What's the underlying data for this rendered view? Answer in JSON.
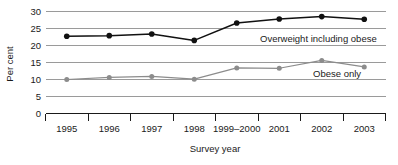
{
  "chart_data": {
    "type": "line",
    "title": "",
    "xlabel": "Survey year",
    "ylabel": "Per cent",
    "categories": [
      "1995",
      "1996",
      "1997",
      "1998",
      "1999–2000",
      "2001",
      "2002",
      "2003"
    ],
    "ylim": [
      0,
      30
    ],
    "ytick_values": [
      0,
      5,
      10,
      15,
      20,
      25,
      30
    ],
    "ytick_labels": [
      "0",
      "5",
      "10",
      "15",
      "20",
      "25",
      "30"
    ],
    "grid": true,
    "legend_position": "inline-annotation",
    "series": [
      {
        "name": "Overweight including obese",
        "color": "#111111",
        "marker": "circle-filled",
        "values": [
          22.7,
          22.9,
          23.4,
          21.5,
          26.6,
          27.8,
          28.5,
          27.7
        ]
      },
      {
        "name": "Obese only",
        "color": "#8c8c8c",
        "marker": "circle-filled",
        "values": [
          10.0,
          10.6,
          10.9,
          10.1,
          13.4,
          13.3,
          15.6,
          13.7
        ]
      }
    ],
    "annotations": [
      {
        "text": "Overweight including obese",
        "series": "Overweight including obese"
      },
      {
        "text": "Obese only",
        "series": "Obese only"
      }
    ]
  },
  "labels": {
    "y_axis_title": "Per cent",
    "x_axis_title": "Survey year",
    "y_ticks": [
      "30",
      "25",
      "20",
      "15",
      "10",
      "5",
      "0"
    ],
    "x_ticks": [
      "1995",
      "1996",
      "1997",
      "1998",
      "1999–2000",
      "2001",
      "2002",
      "2003"
    ],
    "series_one_label": "Overweight including obese",
    "series_two_label": "Obese only"
  },
  "colors": {
    "series_one": "#111111",
    "series_two": "#8c8c8c",
    "gridline": "#9a9a9a",
    "axis": "#1a1a1a",
    "background": "#ffffff",
    "text": "#1a1a1a"
  }
}
